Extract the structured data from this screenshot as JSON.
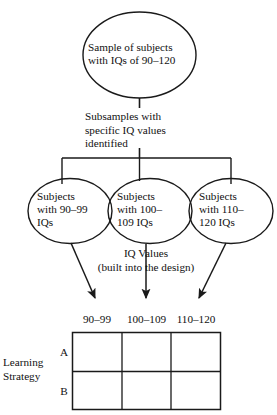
{
  "diagram": {
    "stroke_color": "#1a1a1a",
    "text_color": "#111111",
    "background_color": "#ffffff",
    "top_node": {
      "shape": "ellipse",
      "line1": "Sample of subjects",
      "line2": "with IQs of 90–120"
    },
    "connector_caption": {
      "line1": "Subsamples with",
      "line2": "specific IQ values",
      "line3": "identified"
    },
    "group_nodes": [
      {
        "shape": "ellipse",
        "line1": "Subjects",
        "line2": "with 90–99",
        "line3": "IQs"
      },
      {
        "shape": "ellipse",
        "line1": "Subjects",
        "line2": "with 100–",
        "line3": "109 IQs"
      },
      {
        "shape": "ellipse",
        "line1": "Subjects",
        "line2": "with 110–",
        "line3": "120 IQs"
      }
    ],
    "arrow_caption": {
      "line1": "IQ Values",
      "line2": "(built into the design)"
    },
    "matrix": {
      "column_headers": [
        "90–99",
        "100–109",
        "110–120"
      ],
      "row_labels": [
        "A",
        "B"
      ],
      "factor_label_line1": "Learning",
      "factor_label_line2": "Strategy",
      "cells": [
        [
          "",
          "",
          ""
        ],
        [
          "",
          "",
          ""
        ]
      ]
    }
  }
}
